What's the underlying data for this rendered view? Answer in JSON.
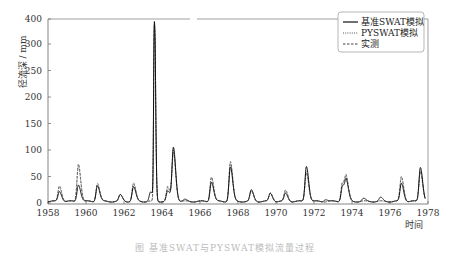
{
  "chart_data": {
    "type": "line",
    "title": "",
    "xlabel": "时间",
    "ylabel": "径流深 / mm",
    "xlim": [
      1958,
      1978
    ],
    "ylim": [
      0,
      400
    ],
    "x_ticks": [
      "1958",
      "1960",
      "1962",
      "1964",
      "1966",
      "1968",
      "1970",
      "1972",
      "1974",
      "1976",
      "1978"
    ],
    "y_ticks": [
      "0",
      "50",
      "100",
      "150",
      "200",
      "250",
      "300",
      "400"
    ],
    "y_axis_note": "broken/compressed scale above 250",
    "grid": false,
    "legend_position": "top-right",
    "series": [
      {
        "name": "基准SWAT模拟",
        "style": "solid",
        "peaks": [
          [
            1958.6,
            22
          ],
          [
            1959.6,
            35
          ],
          [
            1960.6,
            33
          ],
          [
            1961.8,
            15
          ],
          [
            1962.5,
            30
          ],
          [
            1963.4,
            20
          ],
          [
            1963.6,
            385
          ],
          [
            1964.3,
            22
          ],
          [
            1964.6,
            105
          ],
          [
            1965.2,
            6
          ],
          [
            1966.6,
            40
          ],
          [
            1967.6,
            68
          ],
          [
            1968.7,
            24
          ],
          [
            1969.7,
            18
          ],
          [
            1970.5,
            18
          ],
          [
            1971.6,
            70
          ],
          [
            1972.6,
            7
          ],
          [
            1973.5,
            33
          ],
          [
            1973.7,
            38
          ],
          [
            1974.6,
            8
          ],
          [
            1975.5,
            10
          ],
          [
            1976.6,
            37
          ],
          [
            1977.6,
            68
          ]
        ]
      },
      {
        "name": "PYSWAT模拟",
        "style": "dotted",
        "peaks": [
          [
            1958.6,
            30
          ],
          [
            1959.6,
            70
          ],
          [
            1960.6,
            35
          ],
          [
            1961.8,
            15
          ],
          [
            1962.5,
            35
          ],
          [
            1963.6,
            380
          ],
          [
            1964.3,
            28
          ],
          [
            1964.6,
            100
          ],
          [
            1966.6,
            48
          ],
          [
            1967.6,
            75
          ],
          [
            1968.7,
            22
          ],
          [
            1969.7,
            18
          ],
          [
            1970.5,
            22
          ],
          [
            1971.6,
            60
          ],
          [
            1973.5,
            38
          ],
          [
            1973.7,
            42
          ],
          [
            1976.6,
            48
          ],
          [
            1977.6,
            62
          ]
        ]
      },
      {
        "name": "实测",
        "style": "dashed",
        "peaks": [
          [
            1958.6,
            33
          ],
          [
            1959.6,
            75
          ],
          [
            1960.6,
            38
          ],
          [
            1961.8,
            15
          ],
          [
            1962.5,
            37
          ],
          [
            1963.6,
            375
          ],
          [
            1964.3,
            30
          ],
          [
            1964.6,
            95
          ],
          [
            1966.6,
            50
          ],
          [
            1967.6,
            78
          ],
          [
            1968.7,
            22
          ],
          [
            1969.7,
            19
          ],
          [
            1970.5,
            24
          ],
          [
            1971.6,
            58
          ],
          [
            1973.5,
            40
          ],
          [
            1973.7,
            44
          ],
          [
            1976.6,
            50
          ],
          [
            1977.6,
            60
          ]
        ]
      }
    ]
  },
  "legend": {
    "items": [
      {
        "label": "基准SWAT模拟",
        "style": "solid"
      },
      {
        "label": "PYSWAT模拟",
        "style": "dotted"
      },
      {
        "label": "实测",
        "style": "dashed"
      }
    ]
  },
  "axes": {
    "y_title": "径流深 / mm",
    "x_title": "时间"
  },
  "caption": "图 基准SWAT与PYSWAT模拟流量过程"
}
